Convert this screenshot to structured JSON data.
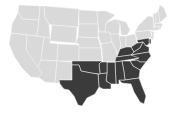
{
  "map": {
    "type": "us-states-choropleth",
    "colors": {
      "background": "#ffffff",
      "default": "#d9d9d9",
      "highlighted": "#3b3b3b",
      "border": "#f4f4f4"
    },
    "highlighted_region": "South",
    "highlighted_states": [
      "TX",
      "OK",
      "AR",
      "LA",
      "MS",
      "AL",
      "TN",
      "KY",
      "GA",
      "FL",
      "SC",
      "NC",
      "VA",
      "WV",
      "MD",
      "DE",
      "DC"
    ],
    "states": [
      {
        "id": "WA",
        "d": "M19,5 L40,6 L39,20 L22,19 L18,13 Z"
      },
      {
        "id": "OR",
        "d": "M18,13 L22,19 L39,20 L37,36 L11,33 L12,24 Z"
      },
      {
        "id": "CA",
        "d": "M11,33 L27,35 L26,50 L44,70 L42,78 L31,77 L22,68 L14,56 L9,44 Z"
      },
      {
        "id": "ID",
        "d": "M40,6 L44,6 L45,17 L49,24 L50,38 L37,36 L39,20 Z"
      },
      {
        "id": "NV",
        "d": "M27,35 L44,37 L41,62 L38,67 L26,50 Z"
      },
      {
        "id": "MT",
        "d": "M44,6 L79,9 L78,27 L52,25 L49,24 L45,17 Z"
      },
      {
        "id": "WY",
        "d": "M52,25 L77,27 L76,43 L50,41 Z"
      },
      {
        "id": "UT",
        "d": "M44,37 L50,38 L50,43 L58,44 L57,61 L41,60 Z"
      },
      {
        "id": "AZ",
        "d": "M41,60 L57,61 L55,83 L45,82 L38,77 L42,74 L38,67 Z"
      },
      {
        "id": "CO",
        "d": "M58,44 L79,45 L79,61 L57,61 Z"
      },
      {
        "id": "NM",
        "d": "M57,61 L73,62 L72,80 L60,80 L59,83 L55,83 Z"
      },
      {
        "id": "ND",
        "d": "M79,10 L97,11 L98,24 L79,24 Z"
      },
      {
        "id": "SD",
        "d": "M79,24 L98,24 L98,38 L78,37 Z"
      },
      {
        "id": "NE",
        "d": "M78,37 L98,38 L101,48 L79,48 L79,44 L76,43 Z"
      },
      {
        "id": "KS",
        "d": "M79,48 L101,48 L102,61 L79,61 Z"
      },
      {
        "id": "MN",
        "d": "M97,11 L106,11 L115,15 L106,23 L105,32 L99,32 L98,24 Z"
      },
      {
        "id": "IA",
        "d": "M98,32 L110,32 L112,42 L101,44 L99,38 Z"
      },
      {
        "id": "MO",
        "d": "M101,44 L112,42 L116,50 L118,58 L115,62 L103,62 L102,50 Z"
      },
      {
        "id": "WI",
        "d": "M106,23 L115,19 L120,24 L119,34 L110,34 L110,32 L105,32 Z"
      },
      {
        "id": "IL",
        "d": "M110,34 L119,34 L121,45 L118,54 L116,50 L112,42 Z"
      },
      {
        "id": "MI",
        "d": "M115,19 L126,22 L130,30 L127,35 L121,35 L120,24 Z"
      },
      {
        "id": "IN",
        "d": "M119,36 L126,36 L126,47 L120,49 L121,45 Z"
      },
      {
        "id": "OH",
        "d": "M126,36 L135,34 L137,43 L131,47 L126,47 Z"
      },
      {
        "id": "PA",
        "d": "M135,32 L150,30 L152,37 L137,40 Z"
      },
      {
        "id": "NY",
        "d": "M138,26 L148,16 L153,17 L154,28 L156,31 L150,30 L135,32 L137,28 Z"
      },
      {
        "id": "VT",
        "d": "M153,14 L156,13 L156,24 L154,24 Z"
      },
      {
        "id": "NH",
        "d": "M156,13 L158,11 L160,22 L156,24 Z"
      },
      {
        "id": "ME",
        "d": "M158,11 L160,5 L164,8 L167,16 L161,22 L160,22 Z"
      },
      {
        "id": "MA",
        "d": "M154,24 L161,23 L163,26 L155,27 Z"
      },
      {
        "id": "CT",
        "d": "M154,27 L159,27 L159,30 L154,30 Z"
      },
      {
        "id": "RI",
        "d": "M159,26 L161,26 L161,29 L159,29 Z"
      },
      {
        "id": "NJ",
        "d": "M151,31 L154,32 L153,40 L150,38 L152,35 Z"
      },
      {
        "id": "DE",
        "d": "M149,39 L151,39 L151,44 L149,43 Z"
      },
      {
        "id": "MD",
        "d": "M137,40 L149,38 L149,44 L146,46 L143,42 L138,43 Z"
      },
      {
        "id": "WV",
        "d": "M131,47 L137,43 L138,43 L143,42 L140,48 L134,52 Z"
      },
      {
        "id": "VA",
        "d": "M134,52 L140,48 L143,42 L146,46 L149,47 L149,52 L131,55 Z"
      },
      {
        "id": "KY",
        "d": "M118,54 L120,49 L126,47 L131,47 L134,52 L131,55 L117,57 Z"
      },
      {
        "id": "TN",
        "d": "M116,57 L131,55 L141,54 L139,58 L115,62 Z"
      },
      {
        "id": "NC",
        "d": "M131,55 L149,52 L151,56 L146,62 L140,62 L137,60 L130,61 L139,58 Z"
      },
      {
        "id": "SC",
        "d": "M130,61 L137,60 L140,62 L146,62 L140,70 L133,66 Z"
      },
      {
        "id": "GA",
        "d": "M122,61 L130,61 L133,66 L140,70 L139,78 L125,80 L124,72 Z"
      },
      {
        "id": "FL",
        "d": "M119,80 L125,80 L139,78 L142,86 L146,96 L144,104 L140,102 L134,92 L131,84 L122,83 Z"
      },
      {
        "id": "AL",
        "d": "M115,62 L122,61 L124,72 L125,80 L119,80 L119,84 L116,84 Z"
      },
      {
        "id": "MS",
        "d": "M107,62 L115,62 L116,84 L111,84 L106,81 L107,73 Z"
      },
      {
        "id": "AR",
        "d": "M101,62 L115,62 L107,62 L107,73 L100,74 L99,64 Z"
      },
      {
        "id": "LA",
        "d": "M98,74 L107,73 L106,81 L111,84 L111,89 L103,89 L99,87 Z"
      },
      {
        "id": "OK",
        "d": "M72,61 L102,61 L101,62 L99,64 L100,74 L91,73 L81,71 L79,65 L72,65 Z"
      },
      {
        "id": "TX",
        "d": "M72,65 L79,65 L81,71 L91,73 L98,74 L99,87 L95,94 L87,98 L82,106 L78,105 L74,96 L69,90 L64,89 L60,84 L59,80 L72,80 Z"
      }
    ]
  }
}
